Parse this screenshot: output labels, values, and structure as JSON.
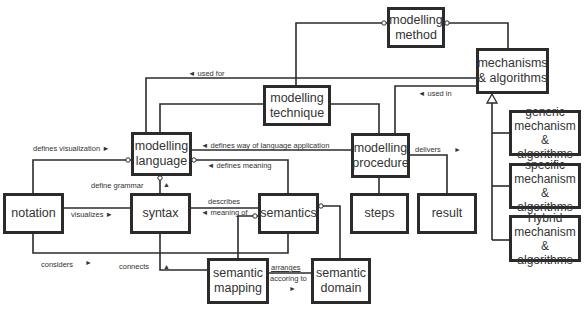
{
  "nodes": {
    "modelling_method": "modelling\nmethod",
    "mechanisms_algorithms": "mechanisms\n& algorithms",
    "modelling_technique": "modelling\ntechnique",
    "modelling_language": "modelling\nlanguage",
    "modelling_procedure": "modelling\nprocedure",
    "notation": "notation",
    "syntax": "syntax",
    "semantics": "semantics",
    "steps": "steps",
    "result": "result",
    "semantic_mapping": "semantic\nmapping",
    "semantic_domain": "semantic\ndomain",
    "generic_mechanism": "generic\nmechanism\n& algorithms",
    "specific_mechanism": "specific\nmechanism\n& algorithms",
    "hybrid_mechanism": "Hybrid\nmechanism\n& algorithms"
  },
  "edges": {
    "used_for": "◄ used for",
    "used_in": "◄ used in",
    "defines_visualization": "defines visualization ►",
    "defines_way": "◄ defines way of language application",
    "delivers": "delivers",
    "delivers_arrow": "►",
    "defines_meaning": "◄ defines meaning",
    "define_grammar": "define grammar",
    "define_grammar_arrow": "▲",
    "visualizes": "visualizes ►",
    "describes": "describes",
    "meaning_of": "◄ meaning of",
    "considers": "considers",
    "considers_arrow": "►",
    "connects": "connects",
    "connects_arrow": "▲",
    "arranges": "arranges",
    "according_to": "accoring to",
    "arranges_arrow": "►"
  },
  "colors": {
    "line": "#2b2b2b",
    "background": "#ffffff"
  }
}
